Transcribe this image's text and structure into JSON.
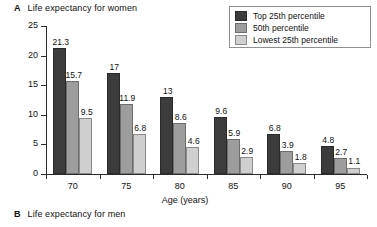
{
  "panels": {
    "a": {
      "letter": "A",
      "title": "Life expectancy for women"
    },
    "b": {
      "letter": "B",
      "title": "Life expectancy for men"
    }
  },
  "legend": {
    "items": [
      {
        "label": "Top 25th percentile",
        "color": "#3c3c3c"
      },
      {
        "label": "50th percentile",
        "color": "#9d9d9d"
      },
      {
        "label": "Lowest 25th percentile",
        "color": "#cfcfcf"
      }
    ]
  },
  "chart_data": {
    "type": "bar",
    "title": "Life expectancy for women",
    "xlabel": "Age (years)",
    "ylabel": "Years",
    "ylim": [
      0,
      25
    ],
    "yticks": [
      0,
      5,
      10,
      15,
      20,
      25
    ],
    "ytick_labels": [
      "0",
      "5",
      "10",
      "15",
      "20",
      "25"
    ],
    "categories": [
      "70",
      "75",
      "80",
      "85",
      "90",
      "95"
    ],
    "xtick_labels": [
      "70",
      "75",
      "80",
      "85",
      "90",
      "95"
    ],
    "grid": false,
    "legend_position": "top-right",
    "series": [
      {
        "name": "Top 25th percentile",
        "color": "#3c3c3c",
        "values": [
          21.3,
          17,
          13,
          9.6,
          6.8,
          4.8
        ],
        "labels": [
          "21.3",
          "17",
          "13",
          "9.6",
          "6.8",
          "4.8"
        ]
      },
      {
        "name": "50th percentile",
        "color": "#9d9d9d",
        "values": [
          15.7,
          11.9,
          8.6,
          5.9,
          3.9,
          2.7
        ],
        "labels": [
          "15.7",
          "11.9",
          "8.6",
          "5.9",
          "3.9",
          "2.7"
        ]
      },
      {
        "name": "Lowest 25th percentile",
        "color": "#cfcfcf",
        "values": [
          9.5,
          6.8,
          4.6,
          2.9,
          1.8,
          1.1
        ],
        "labels": [
          "9.5",
          "6.8",
          "4.6",
          "2.9",
          "1.8",
          "1.1"
        ]
      }
    ]
  }
}
